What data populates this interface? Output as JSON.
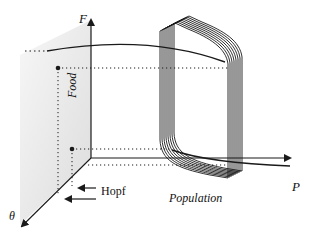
{
  "diagram": {
    "axes": {
      "vertical": {
        "symbol": "F",
        "label": "Food"
      },
      "horizontal": {
        "symbol": "P",
        "label": "Population"
      },
      "depth": {
        "symbol": "θ"
      }
    },
    "annotations": {
      "bifurcation": "Hopf"
    },
    "elements": {
      "stacked_limit_cycles": 8,
      "equilibrium_points": 2,
      "shaded_plane": "F–θ back plane"
    },
    "colors": {
      "ink": "#1a1a1a",
      "plane_shade": "#e6e6e6"
    }
  }
}
